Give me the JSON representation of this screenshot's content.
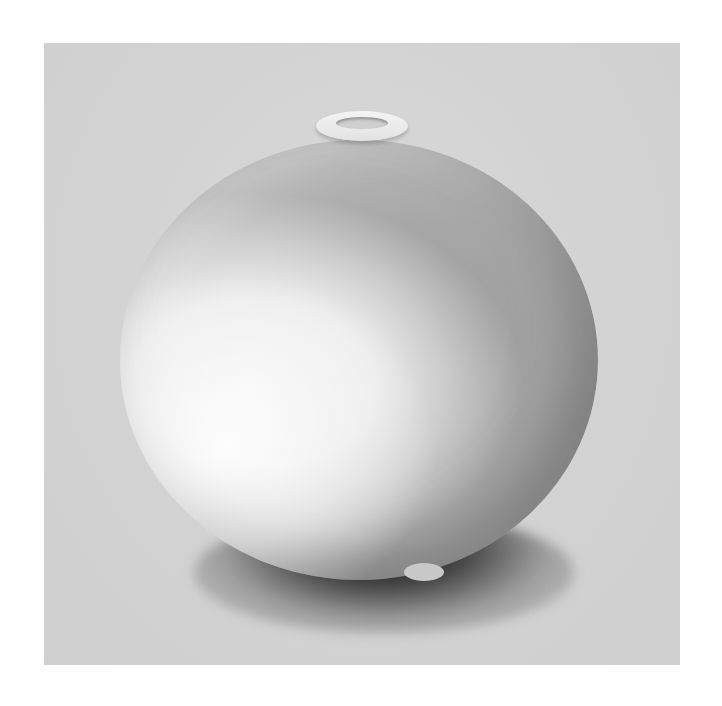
{
  "image": {
    "subject": "spherical ceramic vase with small neck",
    "description": "Round porcelain vase with speckled grey glaze over white body, small lipped opening at top, photographed on grey backdrop with dark shadow beneath",
    "colors": {
      "page_background": "#ffffff",
      "backdrop": "#d4d4d4",
      "glaze_speckled": "#a0a0a0",
      "glaze_white": "#f2f2f2",
      "shadow": "#111111"
    }
  }
}
